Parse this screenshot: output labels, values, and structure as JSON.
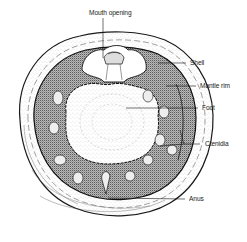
{
  "diagram": {
    "labels": [
      {
        "id": "mouth",
        "text": "Mouth opening",
        "x": 89,
        "y": 11
      },
      {
        "id": "shell",
        "text": "Shell",
        "x": 190,
        "y": 57
      },
      {
        "id": "mantle",
        "text": "Mantle rim",
        "x": 200,
        "y": 79
      },
      {
        "id": "foot",
        "text": "Foot",
        "x": 202,
        "y": 103
      },
      {
        "id": "ctenidia",
        "text": "Ctenidia",
        "x": 205,
        "y": 138
      },
      {
        "id": "anus",
        "text": "Anus",
        "x": 189,
        "y": 194
      }
    ],
    "colors": {
      "ink": "#1a1a1a",
      "paper": "#ffffff",
      "stipple": "#555555"
    }
  }
}
